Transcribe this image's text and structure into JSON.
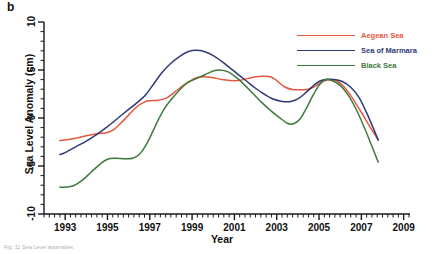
{
  "figure": {
    "panel_label": "b",
    "caption": "Fig. 11 Sea Level anomalies"
  },
  "chart_data": {
    "type": "line",
    "title": "",
    "xlabel": "Year",
    "ylabel": "Sea Level Anomaly (cm)",
    "xlim": [
      1992.0,
      2009.3
    ],
    "ylim": [
      -10,
      10
    ],
    "grid": false,
    "legend_position": "top-right",
    "x_major_ticks": [
      1993,
      1995,
      1997,
      1999,
      2001,
      2003,
      2005,
      2007,
      2009
    ],
    "x_minor_tick_interval": 0.25,
    "y_major_ticks": [
      10,
      5,
      0,
      -5,
      -10
    ],
    "y_minor_tick_interval": 1,
    "x_tick_labels": [
      "1993",
      "1995",
      "1997",
      "1999",
      "2001",
      "2003",
      "2005",
      "2007",
      "2009"
    ],
    "y_tick_labels": [
      "10",
      "5",
      "0",
      "-5",
      "-10"
    ],
    "colors": {
      "aegean": "#e8573f",
      "marmara": "#2f3a78",
      "black": "#3d7a3d",
      "axis": "#1a1a1a",
      "background": "#ffffff"
    },
    "series": [
      {
        "name": "Aegean Sea",
        "color": "#e8573f",
        "x": [
          1992.75,
          1993.0,
          1993.5,
          1994.0,
          1994.5,
          1995.0,
          1995.3,
          1995.6,
          1996.0,
          1996.4,
          1996.8,
          1997.0,
          1997.4,
          1997.8,
          1998.0,
          1998.4,
          1998.8,
          1999.2,
          1999.6,
          2000.0,
          2000.4,
          2000.8,
          2001.2,
          2001.6,
          2002.0,
          2002.3,
          2002.7,
          2003.0,
          2003.4,
          2003.8,
          2004.2,
          2004.5,
          2004.8,
          2005.1,
          2005.4,
          2005.8,
          2006.2,
          2006.6,
          2007.0,
          2007.4,
          2007.8
        ],
        "y": [
          -2.35,
          -2.3,
          -2.1,
          -1.85,
          -1.65,
          -1.5,
          -1.2,
          -0.6,
          0.3,
          1.2,
          1.7,
          1.8,
          1.85,
          2.1,
          2.4,
          3.1,
          3.7,
          4.2,
          4.3,
          4.2,
          4.0,
          3.9,
          3.9,
          4.1,
          4.3,
          4.35,
          4.3,
          3.9,
          3.2,
          2.95,
          2.95,
          3.0,
          3.3,
          3.7,
          3.95,
          3.9,
          3.2,
          2.0,
          0.6,
          -0.9,
          -2.3
        ]
      },
      {
        "name": "Sea of Marmara",
        "color": "#2f3a78",
        "x": [
          1992.75,
          1993.0,
          1993.5,
          1994.0,
          1994.5,
          1995.0,
          1995.5,
          1996.0,
          1996.4,
          1996.8,
          1997.2,
          1997.6,
          1998.0,
          1998.4,
          1998.8,
          1999.2,
          1999.6,
          2000.0,
          2000.4,
          2000.8,
          2001.2,
          2001.6,
          2002.0,
          2002.4,
          2002.8,
          2003.2,
          2003.6,
          2004.0,
          2004.3,
          2004.7,
          2005.0,
          2005.3,
          2005.7,
          2006.1,
          2006.5,
          2006.9,
          2007.3,
          2007.8
        ],
        "y": [
          -3.8,
          -3.6,
          -3.0,
          -2.4,
          -1.7,
          -0.9,
          0.0,
          0.9,
          1.6,
          2.4,
          3.6,
          4.8,
          5.7,
          6.4,
          6.9,
          7.05,
          6.9,
          6.5,
          5.9,
          5.2,
          4.5,
          3.8,
          3.1,
          2.5,
          2.0,
          1.75,
          1.7,
          2.0,
          2.5,
          3.3,
          3.8,
          4.0,
          4.0,
          3.8,
          3.2,
          2.1,
          0.3,
          -2.3
        ]
      },
      {
        "name": "Black Sea",
        "color": "#3d7a3d",
        "x": [
          1992.75,
          1993.0,
          1993.4,
          1993.8,
          1994.2,
          1994.6,
          1995.0,
          1995.4,
          1995.8,
          1996.2,
          1996.5,
          1996.8,
          1997.1,
          1997.4,
          1997.7,
          1998.0,
          1998.4,
          1998.8,
          1999.2,
          1999.6,
          2000.0,
          2000.3,
          2000.7,
          2001.1,
          2001.5,
          2001.9,
          2002.3,
          2002.7,
          2003.1,
          2003.5,
          2003.8,
          2004.1,
          2004.4,
          2004.7,
          2005.0,
          2005.3,
          2005.6,
          2006.0,
          2006.4,
          2006.8,
          2007.2,
          2007.6,
          2007.8
        ],
        "y": [
          -7.2,
          -7.2,
          -7.05,
          -6.5,
          -5.7,
          -4.9,
          -4.3,
          -4.2,
          -4.25,
          -4.2,
          -3.8,
          -2.9,
          -1.6,
          -0.2,
          1.0,
          1.9,
          2.9,
          3.7,
          4.1,
          4.5,
          4.9,
          5.0,
          4.8,
          4.2,
          3.4,
          2.5,
          1.6,
          0.8,
          0.1,
          -0.55,
          -0.6,
          -0.1,
          1.0,
          2.3,
          3.4,
          4.0,
          3.9,
          3.4,
          2.3,
          0.7,
          -1.3,
          -3.5,
          -4.6
        ]
      }
    ]
  },
  "legend": {
    "items": [
      {
        "label": "Aegean Sea",
        "color": "#e8573f"
      },
      {
        "label": "Sea of Marmara",
        "color": "#2f3a78"
      },
      {
        "label": "Black Sea",
        "color": "#3d7a3d"
      }
    ]
  }
}
